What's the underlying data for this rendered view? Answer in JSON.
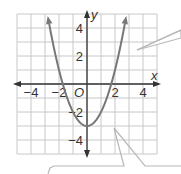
{
  "chart_data": {
    "type": "line",
    "title": "",
    "function": "y = x^2 - 3",
    "xlabel": "x",
    "ylabel": "y",
    "origin_label": "O",
    "xlim": [
      -5,
      5
    ],
    "ylim": [
      -5,
      5
    ],
    "grid": true,
    "grid_step": 1,
    "x_ticks": [
      -4,
      -2,
      2,
      4
    ],
    "x_tick_labels": [
      "−4",
      "−2",
      "2",
      "4"
    ],
    "y_ticks": [
      4,
      2,
      -2,
      -4
    ],
    "y_tick_labels": [
      "4",
      "2",
      "−2",
      "−4"
    ],
    "series": [
      {
        "name": "parabola",
        "color": "#777777",
        "x": [
          -2.83,
          -2.5,
          -2,
          -1.73,
          -1.5,
          -1,
          -0.5,
          0,
          0.5,
          1,
          1.5,
          1.73,
          2,
          2.5,
          2.83
        ],
        "y": [
          5.0,
          3.25,
          1.0,
          0.0,
          -0.75,
          -2.0,
          -2.75,
          -3.0,
          -2.75,
          -2.0,
          -0.75,
          0.0,
          1.0,
          3.25,
          5.0
        ]
      }
    ],
    "vertex": [
      0,
      -3
    ],
    "x_intercepts": [
      -1.73,
      1.73
    ],
    "legend": null
  },
  "colors": {
    "grid": "#c8c8c8",
    "axis": "#333333",
    "curve": "#777777",
    "callout": "#b8b8b8"
  },
  "callouts": [
    {
      "name": "right-callout",
      "tip": [
        137,
        50
      ]
    },
    {
      "name": "bottom-left-callout",
      "tip": [
        113,
        126
      ]
    },
    {
      "name": "bottom-right-callout",
      "tip": [
        116,
        128
      ]
    }
  ]
}
